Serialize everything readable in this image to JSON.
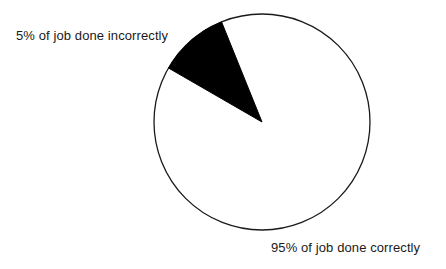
{
  "chart_data": {
    "type": "pie",
    "title": "",
    "subtitle": "",
    "xlabel": "",
    "ylabel": "",
    "grid": false,
    "legend_position": "none",
    "categories": [
      "95% of job done correctly",
      "5% of job done incorrectly"
    ],
    "values": [
      95,
      5
    ],
    "unit": "%",
    "slices": [
      {
        "label": "95% of job done correctly",
        "value": 95,
        "color": "#ffffff",
        "stroke": "#1a1a1a",
        "label_position": "bottom-right"
      },
      {
        "label": "5% of job done incorrectly",
        "value": 5,
        "color": "#000000",
        "stroke": "#000000",
        "label_position": "top-left"
      }
    ],
    "annotations": [
      "5% of job done incorrectly",
      "95% of job done correctly"
    ],
    "geometry": {
      "center_x": 262,
      "center_y": 122,
      "radius": 108,
      "wedge_start_angle_deg": 112,
      "wedge_end_angle_deg": 150
    }
  },
  "labels": {
    "incorrect": "5% of job done incorrectly",
    "correct": "95% of job done correctly"
  },
  "colors": {
    "background": "#ffffff",
    "outline": "#1a1a1a",
    "wedge_fill": "#000000",
    "text": "#1a1a1a"
  }
}
